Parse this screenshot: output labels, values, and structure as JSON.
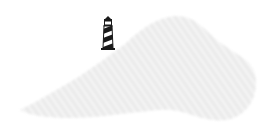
{
  "map": {
    "landmass": {
      "name": "terrain-silhouette",
      "fill_color": "#eeeeee",
      "hatch_color": "#e2e2e2"
    },
    "marker": {
      "icon": "lighthouse-icon",
      "color": "#1a1a1a",
      "position": {
        "x": 108,
        "y": 34
      }
    }
  }
}
